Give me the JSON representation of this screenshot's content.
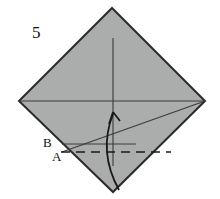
{
  "figure": {
    "kind": "origami-fold-diagram",
    "step_number": "5",
    "background_color": "#ffffff",
    "paper": {
      "name": "square-sheet-rotated-45",
      "fill_color": "#abacac",
      "stroke_color": "#2b2b2b",
      "stroke_width": 2,
      "vertices": {
        "top": [
          112,
          8
        ],
        "right": [
          205,
          101
        ],
        "bottom": [
          113,
          192
        ],
        "left": [
          19,
          101
        ]
      }
    },
    "creases": [
      {
        "name": "horizontal-center-crease",
        "style": "solid",
        "color": "#3a3a3a",
        "from": [
          20,
          101
        ],
        "to": [
          204,
          101
        ]
      },
      {
        "name": "vertical-center-crease",
        "style": "solid",
        "color": "#3a3a3a",
        "from": [
          113,
          38
        ],
        "to": [
          113,
          166
        ]
      },
      {
        "name": "diagonal-fold-crease",
        "style": "solid",
        "color": "#3a3a3a",
        "from": [
          205,
          101
        ],
        "to": [
          62,
          152
        ]
      },
      {
        "name": "fold-target-line-b",
        "style": "solid",
        "color": "#3a3a3a",
        "from": [
          62,
          144
        ],
        "to": [
          136,
          144
        ]
      },
      {
        "name": "fold-line-a-dashed",
        "style": "dashed",
        "color": "#1a1a1a",
        "dash_pattern": "9 6",
        "from": [
          61,
          152
        ],
        "to": [
          171,
          152
        ]
      }
    ],
    "arrow": {
      "name": "fold-up-arrow",
      "style": "curved",
      "color": "#1a1a1a",
      "start": [
        119,
        190
      ],
      "control": [
        99,
        150
      ],
      "end": [
        113,
        113
      ],
      "head_direction": "up"
    },
    "labels": [
      {
        "name": "step-number-label",
        "text": "5"
      },
      {
        "name": "point-b-label",
        "text": "B"
      },
      {
        "name": "point-a-label",
        "text": "A"
      }
    ]
  }
}
